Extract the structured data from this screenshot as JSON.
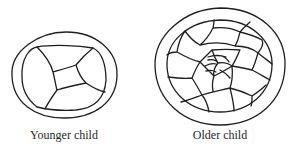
{
  "figure": {
    "panels": [
      {
        "id": "younger",
        "caption": "Younger child",
        "description": "Double-ringed ellipse with a few large irregular cells (about 5) meeting around a small central quadrilateral"
      },
      {
        "id": "older",
        "caption": "Older child",
        "description": "Double-ringed ellipse filled with many small irregular cells converging in a spiral-like pattern toward the center"
      }
    ],
    "line_color": "#1f1f1f",
    "background_color": "#ffffff"
  }
}
